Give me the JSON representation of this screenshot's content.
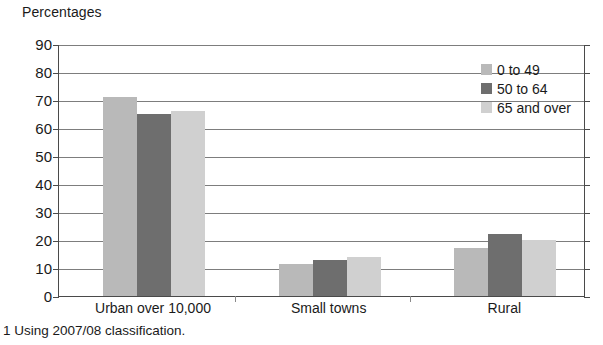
{
  "chart_data": {
    "type": "bar",
    "title": "Percentages",
    "xlabel": "",
    "ylabel": "Percentages",
    "ylim": [
      0,
      90
    ],
    "ytick_step": 10,
    "yticks": [
      90,
      80,
      70,
      60,
      50,
      40,
      30,
      20,
      10,
      0
    ],
    "grid": true,
    "legend_position": "top-right",
    "categories": [
      "Urban over 10,000",
      "Small towns",
      "Rural"
    ],
    "series": [
      {
        "name": "0 to 49",
        "color": "#b9b9b9",
        "values": [
          71,
          11.5,
          17
        ]
      },
      {
        "name": "50 to 64",
        "color": "#6e6e6e",
        "values": [
          65,
          13,
          22
        ]
      },
      {
        "name": "65 and over",
        "color": "#d0d0d0",
        "values": [
          66,
          14,
          20
        ]
      }
    ]
  },
  "footnote": "1 Using 2007/08 classification.",
  "axis": {
    "line_color": "#4a4a4a",
    "grid_color": "#7d7d7d"
  }
}
